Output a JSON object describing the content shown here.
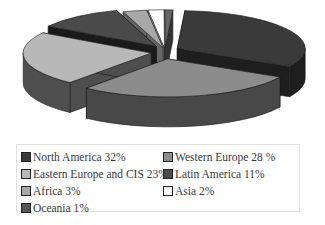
{
  "chart_data": {
    "type": "pie",
    "style": "3d-exploded",
    "title": "",
    "categories": [
      "North America",
      "Western Europe",
      "Eastern Europe and CIS",
      "Latin America",
      "Africa",
      "Asia",
      "Oceania"
    ],
    "values": [
      32,
      28,
      23,
      11,
      3,
      2,
      1
    ],
    "unit": "%",
    "legend_position": "bottom",
    "colors": [
      "#3a3a3a",
      "#8c8c8c",
      "#b8b8b8",
      "#4a4a4a",
      "#a8a8a8",
      "#ffffff",
      "#666666"
    ],
    "side_colors": [
      "#1e1e1e",
      "#484848",
      "#4e4e4e",
      "#1a1a1a",
      "#666666",
      "#cccccc",
      "#333333"
    ]
  },
  "legend": {
    "items": [
      {
        "label": "North America 32%",
        "color": "#3a3a3a"
      },
      {
        "label": "Western Europe 28 %",
        "color": "#8c8c8c"
      },
      {
        "label": "Eastern Europe and CIS 23%",
        "color": "#b8b8b8"
      },
      {
        "label": "Latin America 11%",
        "color": "#4a4a4a"
      },
      {
        "label": "Africa 3%",
        "color": "#a8a8a8"
      },
      {
        "label": "Asia 2%",
        "color": "#ffffff"
      },
      {
        "label": "Oceania 1%",
        "color": "#555555"
      }
    ]
  }
}
